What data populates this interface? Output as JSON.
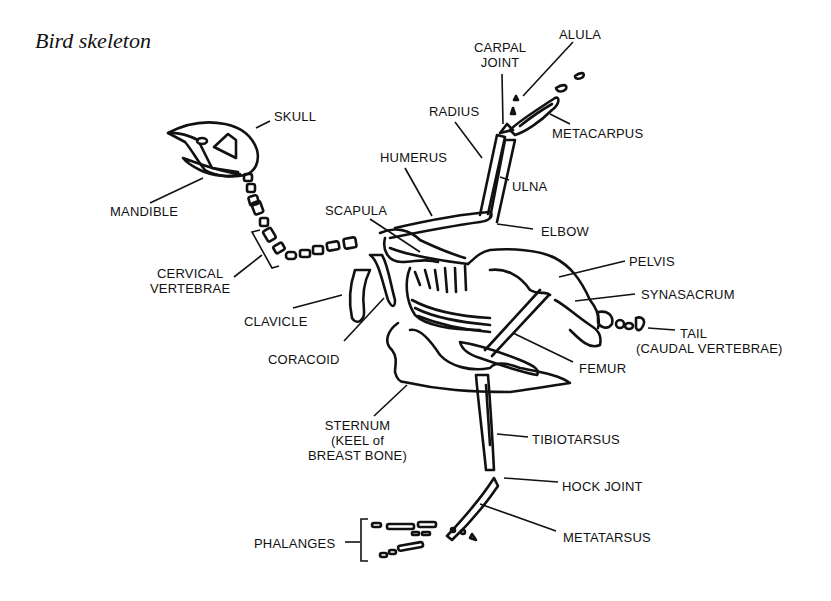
{
  "title": "Bird skeleton",
  "labels": {
    "skull": "SKULL",
    "mandible": "MANDIBLE",
    "cervical_1": "CERVICAL",
    "cervical_2": "VERTEBRAE",
    "clavicle": "CLAVICLE",
    "coracoid": "CORACOID",
    "scapula": "SCAPULA",
    "humerus": "HUMERUS",
    "radius": "RADIUS",
    "carpal_1": "CARPAL",
    "carpal_2": "JOINT",
    "alula": "ALULA",
    "metacarpus": "METACARPUS",
    "ulna": "ULNA",
    "elbow": "ELBOW",
    "pelvis": "PELVIS",
    "synasacrum": "SYNASACRUM",
    "tail_1": "TAIL",
    "tail_2": "(CAUDAL VERTEBRAE)",
    "femur": "FEMUR",
    "sternum_1": "STERNUM",
    "sternum_2": "(KEEL of",
    "sternum_3": "BREAST BONE)",
    "tibiotarsus": "TIBIOTARSUS",
    "hock": "HOCK JOINT",
    "metatarsus": "METATARSUS",
    "phalanges": "PHALANGES"
  }
}
